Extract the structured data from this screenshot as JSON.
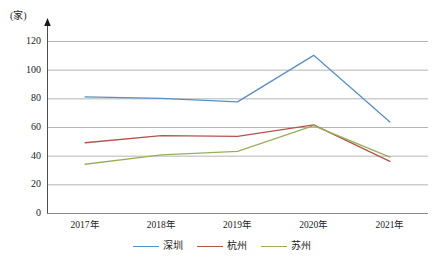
{
  "chart_data": {
    "type": "line",
    "title": "",
    "xlabel": "",
    "ylabel": "",
    "unit_label": "(家)",
    "categories": [
      "2017年",
      "2018年",
      "2019年",
      "2020年",
      "2021年"
    ],
    "series": [
      {
        "name": "深圳",
        "color": "#5B8FC4",
        "values": [
          81,
          80,
          77.5,
          110,
          63.5
        ]
      },
      {
        "name": "杭州",
        "color": "#B5534B",
        "values": [
          49,
          54,
          53.5,
          61.5,
          36
        ]
      },
      {
        "name": "苏州",
        "color": "#96B05A",
        "values": [
          34,
          40.5,
          43,
          61,
          39
        ]
      }
    ],
    "ylim": [
      0,
      120
    ],
    "yticks": [
      0,
      20,
      40,
      60,
      80,
      100,
      120
    ],
    "ytick_labels": [
      "0",
      "20",
      "40",
      "60",
      "80",
      "100",
      "120"
    ],
    "grid": true,
    "legend_position": "bottom",
    "axis_arrow": true
  }
}
